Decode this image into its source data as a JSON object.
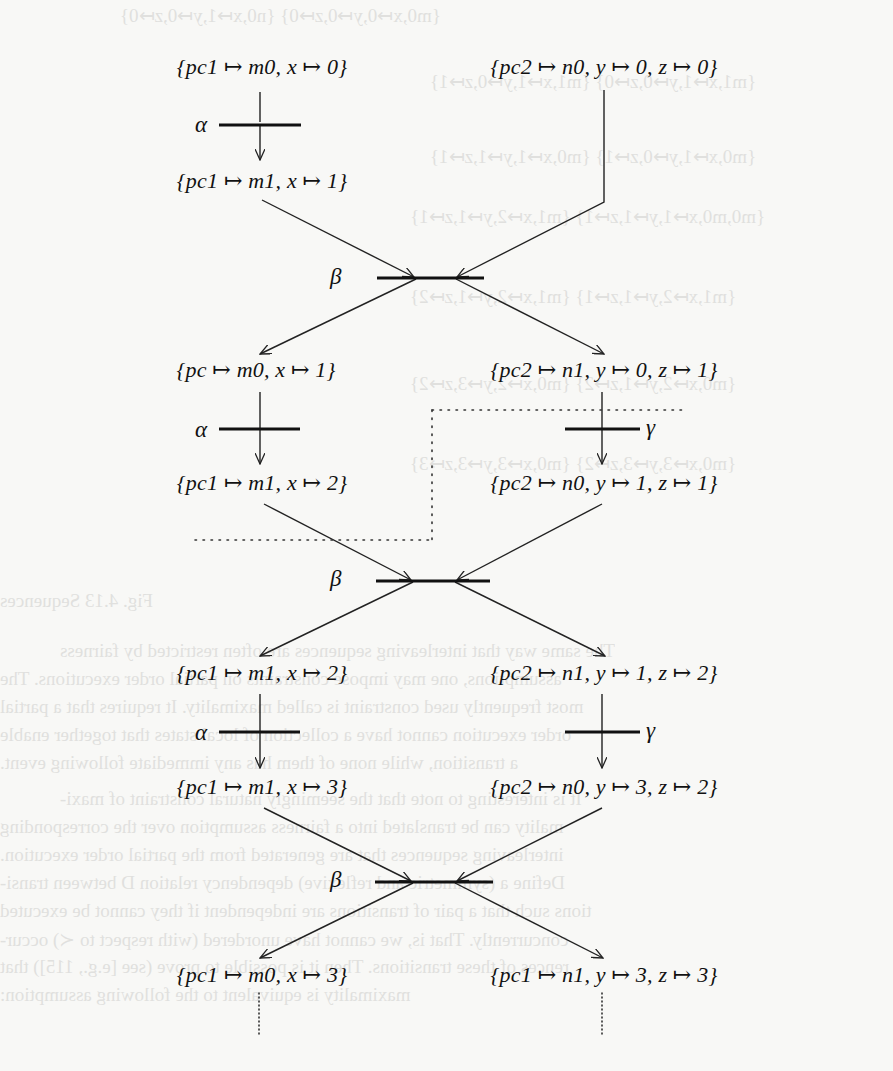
{
  "diagram": {
    "type": "occurrence-net-unfolding",
    "nodes": [
      {
        "id": "s0a",
        "text": "{pc1 ↦ m0, x ↦ 0}",
        "x": 262,
        "y": 54
      },
      {
        "id": "s0b",
        "text": "{pc2 ↦ n0, y ↦ 0, z ↦ 0}",
        "x": 604,
        "y": 54
      },
      {
        "id": "s1a",
        "text": "{pc1 ↦ m1, x ↦ 1}",
        "x": 262,
        "y": 168
      },
      {
        "id": "s2a",
        "text": "{pc ↦ m0, x ↦ 1}",
        "x": 259,
        "y": 357
      },
      {
        "id": "s2b",
        "text": "{pc2 ↦ n1, y ↦ 0, z ↦ 1}",
        "x": 604,
        "y": 357
      },
      {
        "id": "s3a",
        "text": "{pc1 ↦ m1, x ↦ 2}",
        "x": 262,
        "y": 470
      },
      {
        "id": "s3b",
        "text": "{pc2 ↦ n0, y ↦ 1, z ↦ 1}",
        "x": 604,
        "y": 470
      },
      {
        "id": "s4a",
        "text": "{pc1 ↦ m1, x ↦ 2}",
        "x": 262,
        "y": 660
      },
      {
        "id": "s4b",
        "text": "{pc2 ↦ n1, y ↦ 1, z ↦ 2}",
        "x": 604,
        "y": 660
      },
      {
        "id": "s5a",
        "text": "{pc1 ↦ m1, x ↦ 3}",
        "x": 262,
        "y": 774
      },
      {
        "id": "s5b",
        "text": "{pc2 ↦ n0, y ↦ 3, z ↦ 2}",
        "x": 604,
        "y": 774
      },
      {
        "id": "s6a",
        "text": "{pc1 ↦ m0, x ↦ 3}",
        "x": 262,
        "y": 962
      },
      {
        "id": "s6b",
        "text": "{pc1 ↦ n1, y ↦ 3, z ↦ 3}",
        "x": 604,
        "y": 962
      }
    ],
    "transitions": [
      {
        "id": "t1",
        "label": "α",
        "x": 195,
        "y": 112
      },
      {
        "id": "t2",
        "label": "β",
        "x": 330,
        "y": 264
      },
      {
        "id": "t3",
        "label": "α",
        "x": 195,
        "y": 417
      },
      {
        "id": "t4",
        "label": "γ",
        "x": 644,
        "y": 415
      },
      {
        "id": "t5",
        "label": "β",
        "x": 330,
        "y": 566
      },
      {
        "id": "t6",
        "label": "α",
        "x": 195,
        "y": 720
      },
      {
        "id": "t7",
        "label": "γ",
        "x": 644,
        "y": 718
      },
      {
        "id": "t8",
        "label": "β",
        "x": 330,
        "y": 867
      }
    ],
    "cut_annotation": "dotted cut line separating configuration"
  },
  "bleed_through": {
    "lines": [
      {
        "text": "{m0,x↦0,y↦0,z↦0}   {n0,x↦1,y↦0,z↦0}",
        "x": 120,
        "y": 4
      },
      {
        "text": "{m1,x↦1,y↦0,z↦0}   {m1,x↦1,y↦0,z↦1}",
        "x": 420,
        "y": 70
      },
      {
        "text": "{m0,x↦1,y↦0,z↦1}   {m0,x↦1,y↦1,z↦1}",
        "x": 420,
        "y": 145
      },
      {
        "text": "{m0,m0,x↦1,y↦1,z↦1}   {m1,x↦2,y↦1,z↦1}",
        "x": 400,
        "y": 205
      },
      {
        "text": "{m1,x↦2,y↦1,z↦1}   {m1,x↦2,y↦1,z↦2}",
        "x": 400,
        "y": 280
      },
      {
        "text": "{m0,x↦2,y↦1,z↦2}   {m0,x↦2,y↦3,z↦2}",
        "x": 400,
        "y": 370
      },
      {
        "text": "{m0,x↦3,y↦3,z↦2}   {m0,x↦3,y↦3,z↦3}",
        "x": 400,
        "y": 450
      },
      {
        "text": "Fig. 4.13  Sequences",
        "x": 0,
        "y": 590
      },
      {
        "text": "The same way that interleaving sequences are often restricted by fairness",
        "x": 60,
        "y": 640
      },
      {
        "text": "assumptions, one may impose constraints on partial order executions. The",
        "x": 0,
        "y": 668
      },
      {
        "text": "most frequently used constraint is called maximality. It requires that a partial",
        "x": 0,
        "y": 696
      },
      {
        "text": "order execution cannot have a collection of local states that together enable",
        "x": 0,
        "y": 724
      },
      {
        "text": "a transition, while none of them has any immediate following event.",
        "x": 0,
        "y": 752
      },
      {
        "text": "It is interesting to note that the seemingly natural constraint of maxi-",
        "x": 60,
        "y": 788
      },
      {
        "text": "mality can be translated into a fairness assumption over the corresponding",
        "x": 0,
        "y": 816
      },
      {
        "text": "interleaving sequences that are generated from the partial order execution.",
        "x": 0,
        "y": 844
      },
      {
        "text": "Define a (symmetric and reflexive) dependency relation D between transi-",
        "x": 0,
        "y": 872
      },
      {
        "text": "tions such that a pair of transitions are independent if they cannot be executed",
        "x": 0,
        "y": 900
      },
      {
        "text": "concurrently. That is, we cannot have unordered (with respect to ≺) occur-",
        "x": 0,
        "y": 928
      },
      {
        "text": "rences of these transitions. Then it is possible to prove (see [e.g., 115]) that",
        "x": 0,
        "y": 956
      },
      {
        "text": "maximality is equivalent to the following assumption:",
        "x": 0,
        "y": 984
      }
    ]
  }
}
